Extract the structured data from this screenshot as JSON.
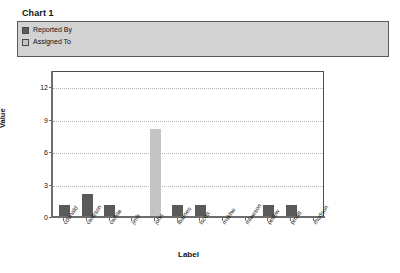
{
  "chart_title": "Chart 1",
  "legend": {
    "entries": [
      {
        "label": "Reported By",
        "color": "#5a5a5a"
      },
      {
        "label": "Assigned To",
        "color": "#c4c4c4"
      }
    ]
  },
  "axes": {
    "ylabel": "Value",
    "xlabel": "Label",
    "yticks": [
      "0",
      "3",
      "6",
      "9",
      "12"
    ]
  },
  "chart_data": {
    "type": "bar",
    "title": "Chart 1",
    "xlabel": "Label",
    "ylabel": "Value",
    "ylim": [
      0,
      13.5
    ],
    "yticks": [
      0,
      3,
      6,
      9,
      12
    ],
    "grid": true,
    "legend_position": "top",
    "categories": [
      "cdonald",
      "cwatson",
      "cwhite",
      "jimb",
      "john",
      "lbarnes",
      "lscott",
      "mskhw",
      "mlawson",
      "pellew",
      "pmatt",
      "rhudson"
    ],
    "series": [
      {
        "name": "Reported By",
        "color": "#5a5a5a",
        "values": [
          1,
          2,
          1,
          0,
          0,
          1,
          1,
          0,
          0,
          1,
          1,
          0
        ]
      },
      {
        "name": "Assigned To",
        "color": "#c4c4c4",
        "values": [
          0,
          0,
          0,
          0,
          8,
          0,
          0,
          0,
          0,
          0,
          0,
          0
        ]
      }
    ]
  }
}
